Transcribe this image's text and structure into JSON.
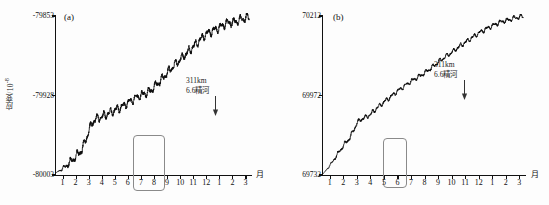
{
  "figure": {
    "background": "#fdfdfd",
    "line_color": "#0d0d0d",
    "axis_color": "#111111",
    "highlight_color": "#8a8a8a"
  },
  "panels": [
    {
      "letter": "(a)",
      "ylabel_text": "应变/10",
      "ylabel_exp": "-8",
      "xaxis_name": "月",
      "yticks": [
        "-79853",
        "-79928",
        "-80003"
      ],
      "xticks": [
        "1",
        "2",
        "3",
        "4",
        "5",
        "6",
        "7",
        "8",
        "9",
        "10",
        "11",
        "12",
        "1",
        "2",
        "3"
      ],
      "annotation": {
        "line1": "311km",
        "line2": "6.6精河"
      }
    },
    {
      "letter": "(b)",
      "ylabel_text": "应变/10",
      "ylabel_exp": "-8",
      "xaxis_name": "月",
      "yticks": [
        "70212",
        "69972",
        "69732"
      ],
      "xticks": [
        "1",
        "2",
        "3",
        "4",
        "5",
        "6",
        "7",
        "8",
        "9",
        "10",
        "11",
        "12",
        "1",
        "2",
        "3"
      ],
      "annotation": {
        "line1": "311km",
        "line2": "6.6精河"
      }
    }
  ],
  "chart_data": {
    "type": "line",
    "title": "",
    "xlabel": "月",
    "ylabel": "应变/10^-8",
    "grid": false,
    "legend": "none",
    "panels": [
      {
        "name": "(a)",
        "ylim": [
          -80003,
          -79853
        ],
        "yticks": [
          -80003,
          -79928,
          -79853
        ],
        "xlim": [
          0.5,
          15.5
        ],
        "xticks": [
          1,
          2,
          3,
          4,
          5,
          6,
          7,
          8,
          9,
          10,
          11,
          12,
          13,
          14,
          15
        ],
        "xticklabels": [
          "1",
          "2",
          "3",
          "4",
          "5",
          "6",
          "7",
          "8",
          "9",
          "10",
          "11",
          "12",
          "1",
          "2",
          "3"
        ],
        "annotations": [
          {
            "label_line1": "311km",
            "label_line2": "6.6精河",
            "x": 7.8,
            "marker": "down-arrow"
          },
          {
            "label": "anomaly-highlight-box",
            "x_range": [
              2.1,
              3.6
            ],
            "y_range": [
              -79985,
              -79935
            ],
            "shape": "rounded-rect"
          }
        ],
        "x": [
          0.5,
          1.0,
          1.5,
          2.0,
          2.5,
          3.0,
          3.3,
          3.6,
          4.0,
          4.5,
          5.0,
          5.5,
          6.0,
          6.5,
          7.0,
          7.5,
          7.8,
          8.0,
          8.5,
          9.0,
          9.5,
          10.0,
          10.5,
          11.0,
          11.5,
          12.0,
          12.5,
          13.0,
          13.5,
          14.0,
          14.5,
          15.0,
          15.3
        ],
        "y": [
          -80001,
          -79997,
          -79992,
          -79986,
          -79979,
          -79962,
          -79953,
          -79950,
          -79948,
          -79945,
          -79942,
          -79939,
          -79935,
          -79931,
          -79928,
          -79925,
          -79923,
          -79920,
          -79914,
          -79907,
          -79900,
          -79894,
          -79888,
          -79882,
          -79876,
          -79870,
          -79867,
          -79864,
          -79860,
          -79859,
          -79857,
          -79855,
          -79854
        ],
        "oscillation_amplitude": 3.5,
        "oscillation_period_months": 0.5
      },
      {
        "name": "(b)",
        "ylim": [
          69732,
          70212
        ],
        "yticks": [
          69732,
          69972,
          70212
        ],
        "xlim": [
          0.5,
          15.5
        ],
        "xticks": [
          1,
          2,
          3,
          4,
          5,
          6,
          7,
          8,
          9,
          10,
          11,
          12,
          13,
          14,
          15
        ],
        "xticklabels": [
          "1",
          "2",
          "3",
          "4",
          "5",
          "6",
          "7",
          "8",
          "9",
          "10",
          "11",
          "12",
          "1",
          "2",
          "3"
        ],
        "annotations": [
          {
            "label_line1": "311km",
            "label_line2": "6.6精河",
            "x": 7.8,
            "marker": "down-arrow"
          },
          {
            "label": "anomaly-highlight-box",
            "x_range": [
              2.2,
              3.4
            ],
            "y_range": [
              69838,
              69918
            ],
            "shape": "rounded-rect"
          }
        ],
        "x": [
          0.5,
          1.0,
          1.5,
          2.0,
          2.5,
          3.0,
          3.3,
          3.6,
          4.0,
          4.5,
          5.0,
          5.5,
          6.0,
          6.5,
          7.0,
          7.5,
          7.8,
          8.0,
          8.5,
          9.0,
          9.5,
          10.0,
          10.5,
          11.0,
          11.5,
          12.0,
          12.5,
          13.0,
          13.5,
          14.0,
          14.5,
          15.0,
          15.3
        ],
        "y": [
          69735,
          69760,
          69790,
          69820,
          69845,
          69888,
          69900,
          69905,
          69915,
          69935,
          69952,
          69968,
          69985,
          70000,
          70014,
          70028,
          70034,
          70040,
          70055,
          70072,
          70088,
          70102,
          70118,
          70132,
          70146,
          70160,
          70172,
          70182,
          70192,
          70198,
          70204,
          70209,
          70211
        ],
        "oscillation_amplitude": 6,
        "oscillation_period_months": 0.5
      }
    ]
  }
}
